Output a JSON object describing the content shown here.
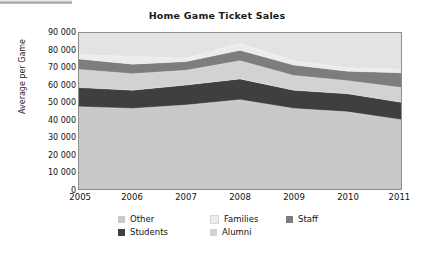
{
  "chart_data": {
    "type": "area",
    "stacked": true,
    "title": "Home Game Ticket Sales",
    "xlabel": "",
    "ylabel": "Average per Game",
    "x": [
      2005,
      2006,
      2007,
      2008,
      2009,
      2010,
      2011
    ],
    "categories": [
      "2005",
      "2006",
      "2007",
      "2008",
      "2009",
      "2010",
      "2011"
    ],
    "xtick_labels": [
      "2005",
      "2006",
      "2007",
      "2008",
      "2009",
      "2010",
      "2011"
    ],
    "ytick_labels": [
      "90 000",
      "80 000",
      "70 000",
      "60 000",
      "50 000",
      "40 000",
      "30 000",
      "20 000",
      "10 000",
      "0"
    ],
    "ytick_values": [
      90000,
      80000,
      70000,
      60000,
      50000,
      40000,
      30000,
      20000,
      10000,
      0
    ],
    "ylim": [
      0,
      90000
    ],
    "ytick_step": 10000,
    "grid": false,
    "legend_position": "bottom",
    "stack_order_bottom_to_top": [
      "Other",
      "Students",
      "Alumni",
      "Staff",
      "Families"
    ],
    "series": [
      {
        "name": "Other",
        "color": "#c9c9c9",
        "values": [
          47500,
          46500,
          48500,
          51500,
          46500,
          44500,
          40000
        ]
      },
      {
        "name": "Students",
        "color": "#3f3f3f",
        "values": [
          11000,
          10500,
          11500,
          12000,
          10500,
          10500,
          10000
        ]
      },
      {
        "name": "Alumni",
        "color": "#d2d2d2",
        "values": [
          10500,
          9500,
          8500,
          10500,
          8500,
          7500,
          8500
        ]
      },
      {
        "name": "Staff",
        "color": "#7d7d7d",
        "values": [
          6000,
          5500,
          5000,
          6000,
          6000,
          5500,
          8500
        ]
      },
      {
        "name": "Families",
        "color": "#ececec",
        "values": [
          2500,
          4500,
          2000,
          4000,
          2500,
          2000,
          2000
        ]
      }
    ],
    "stack_tops": {
      "Other": [
        47500,
        46500,
        48500,
        51500,
        46500,
        44500,
        40000
      ],
      "Students": [
        58500,
        57000,
        60000,
        63500,
        57000,
        55000,
        50000
      ],
      "Alumni": [
        69000,
        66500,
        68500,
        74000,
        65500,
        62500,
        58500
      ],
      "Staff": [
        75000,
        72000,
        73500,
        80000,
        71500,
        68000,
        67000
      ],
      "Families": [
        77500,
        76500,
        75500,
        84000,
        74000,
        70000,
        69000
      ]
    },
    "legend": [
      {
        "label": "Other",
        "color": "#c9c9c9"
      },
      {
        "label": "Families",
        "color": "#ececec"
      },
      {
        "label": "Staff",
        "color": "#7d7d7d"
      },
      {
        "label": "Students",
        "color": "#3f3f3f"
      },
      {
        "label": "Alumni",
        "color": "#d2d2d2"
      }
    ]
  }
}
